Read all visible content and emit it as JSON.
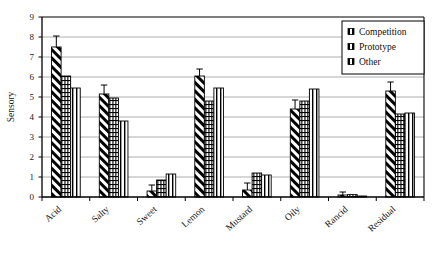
{
  "chart_data": {
    "type": "bar",
    "title": "",
    "subtitle": "",
    "xlabel": "",
    "ylabel": "Sensory",
    "ylim": [
      0,
      9
    ],
    "ytick_labels": [
      "0",
      "1",
      "2",
      "3",
      "4",
      "5",
      "6",
      "7",
      "8",
      "9"
    ],
    "ytick_values": [
      0,
      1,
      2,
      3,
      4,
      5,
      6,
      7,
      8,
      9
    ],
    "grid": "horizontal",
    "legend_position": "top-right",
    "categories": [
      "Acid",
      "Salty",
      "Sweet",
      "Lemon",
      "Mustard",
      "Oily",
      "Rancid",
      "Residual"
    ],
    "series": [
      {
        "name": "Competition",
        "pattern": "diagonal-stripes",
        "values": [
          7.5,
          5.15,
          0.3,
          6.05,
          0.35,
          4.4,
          0.1,
          5.3
        ],
        "errors": [
          0.55,
          0.45,
          0.3,
          0.35,
          0.35,
          0.45,
          0.15,
          0.45
        ]
      },
      {
        "name": "Prototype",
        "pattern": "brick-hatch",
        "values": [
          6.05,
          4.95,
          0.85,
          4.8,
          1.2,
          4.8,
          0.12,
          4.15
        ],
        "errors": [
          0,
          0,
          0,
          0,
          0,
          0,
          0,
          0
        ]
      },
      {
        "name": "Other",
        "pattern": "vertical-lines",
        "values": [
          5.45,
          3.8,
          1.15,
          5.45,
          1.1,
          5.4,
          0.05,
          4.2
        ],
        "errors": [
          0,
          0,
          0,
          0,
          0,
          0,
          0,
          0
        ]
      }
    ],
    "colors": {
      "bar_outline": "#000000",
      "bar_fill": "#ffffff",
      "gridline": "#9a9a9a",
      "axis": "#000000",
      "background": "#ffffff"
    }
  }
}
